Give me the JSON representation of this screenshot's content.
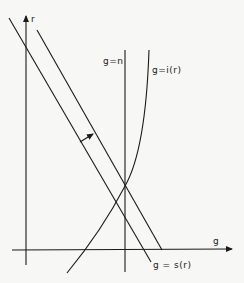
{
  "diagram": {
    "axes": {
      "x_label": "g",
      "y_label": "r"
    },
    "curves": [
      {
        "id": "g_eq_n",
        "label": "g=n",
        "type": "vertical-line"
      },
      {
        "id": "g_eq_i_r",
        "label": "g=i(r)",
        "type": "upward-sloping-curve"
      },
      {
        "id": "g_eq_s_r",
        "label": "g = s(r)",
        "type": "downward-sloping-line"
      },
      {
        "id": "g_eq_s_r_shifted",
        "label": "",
        "type": "downward-sloping-line-shifted-right"
      }
    ],
    "annotations": [
      {
        "type": "arrow",
        "meaning": "shift of s(r) line outward/rightward"
      }
    ],
    "colors": {
      "ink": "#1a1a1a",
      "paper": "#f7f7f5"
    }
  }
}
